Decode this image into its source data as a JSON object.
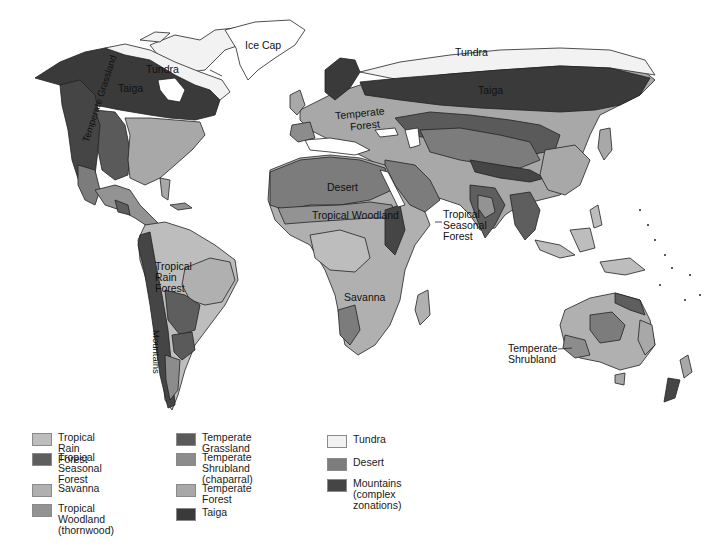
{
  "map": {
    "labels": {
      "ice_cap": "Ice Cap",
      "tundra_na": "Tundra",
      "tundra_eu": "Tundra",
      "taiga_na": "Taiga",
      "taiga_eu": "Taiga",
      "temperate_grassland": "Temperate Grassland",
      "temperate_forest_line1": "Temperate",
      "temperate_forest_line2": "Forest",
      "desert": "Desert",
      "tropical_woodland": "Tropical Woodland",
      "tropical_seasonal_line1": "Tropical",
      "tropical_seasonal_line2": "Seasonal",
      "tropical_seasonal_line3": "Forest",
      "tropical_rain_line1": "Tropical",
      "tropical_rain_line2": "Rain",
      "tropical_rain_line3": "Forest",
      "savanna": "Savanna",
      "mountains": "Mountains",
      "temperate_shrubland_line1": "Temperate",
      "temperate_shrubland_line2": "Shrubland"
    },
    "colors": {
      "ocean": "#ffffff",
      "tundra": "#f2f2f2",
      "ice": "#ffffff",
      "taiga": "#3a3a3a",
      "temperate_forest": "#a8a8a8",
      "temperate_grassland": "#5a5a5a",
      "temperate_shrubland": "#8c8c8c",
      "desert": "#7c7c7c",
      "tropical_rain_forest": "#bdbdbd",
      "tropical_seasonal_forest": "#5e5e5e",
      "savanna": "#b0b0b0",
      "tropical_woodland": "#939393",
      "mountains": "#454545",
      "coast": "#222222"
    }
  },
  "legend": {
    "columns": [
      {
        "items": [
          {
            "label_lines": [
              "Tropical Rain Forest"
            ],
            "color": "#bdbdbd"
          },
          {
            "label_lines": [
              "Tropical Seasonal",
              "Forest"
            ],
            "color": "#5e5e5e"
          },
          {
            "label_lines": [
              "Savanna"
            ],
            "color": "#b0b0b0"
          },
          {
            "label_lines": [
              "Tropical Woodland",
              "(thornwood)"
            ],
            "color": "#939393"
          }
        ]
      },
      {
        "items": [
          {
            "label_lines": [
              "Temperate Grassland"
            ],
            "color": "#5a5a5a"
          },
          {
            "label_lines": [
              "Temperate Shrubland",
              "(chaparral)"
            ],
            "color": "#8c8c8c"
          },
          {
            "label_lines": [
              "Temperate Forest"
            ],
            "color": "#a8a8a8"
          },
          {
            "label_lines": [
              "Taiga"
            ],
            "color": "#3a3a3a"
          }
        ]
      },
      {
        "items": [
          {
            "label_lines": [
              "Tundra"
            ],
            "color": "#f2f2f2"
          },
          {
            "label_lines": [
              "Desert"
            ],
            "color": "#7c7c7c"
          },
          {
            "label_lines": [
              "Mountains",
              "(complex zonations)"
            ],
            "color": "#454545"
          }
        ]
      }
    ]
  }
}
